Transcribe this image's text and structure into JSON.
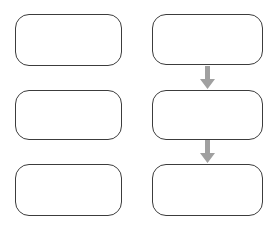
{
  "canvas": {
    "width": 276,
    "height": 232,
    "background_color": "#ffffff"
  },
  "style": {
    "node_stroke_color": "#3c3c3c",
    "node_fill_color": "#ffffff",
    "arrow_color": "#a0a0a0",
    "node_corner_radius": 14,
    "node_stroke_width": 1.4
  },
  "columns": [
    {
      "id": "left-column",
      "name": "left-column",
      "x": 15,
      "width": 107,
      "has_connectors": false
    },
    {
      "id": "right-column",
      "name": "right-column",
      "x": 152,
      "width": 111,
      "has_connectors": true
    }
  ],
  "nodes": [
    {
      "id": "left-node-1",
      "label": "",
      "column": "left-column",
      "row": 1,
      "x": 15,
      "y": 14,
      "width": 107,
      "height": 52
    },
    {
      "id": "left-node-2",
      "label": "",
      "column": "left-column",
      "row": 2,
      "x": 15,
      "y": 90,
      "width": 107,
      "height": 50
    },
    {
      "id": "left-node-3",
      "label": "",
      "column": "left-column",
      "row": 3,
      "x": 15,
      "y": 164,
      "width": 107,
      "height": 52
    },
    {
      "id": "right-node-1",
      "label": "",
      "column": "right-column",
      "row": 1,
      "x": 152,
      "y": 14,
      "width": 111,
      "height": 51
    },
    {
      "id": "right-node-2",
      "label": "",
      "column": "right-column",
      "row": 2,
      "x": 152,
      "y": 90,
      "width": 111,
      "height": 50
    },
    {
      "id": "right-node-3",
      "label": "",
      "column": "right-column",
      "row": 3,
      "x": 152,
      "y": 164,
      "width": 111,
      "height": 52
    }
  ],
  "connectors": [
    {
      "id": "arrow-right-1-to-2",
      "name": "arrow-down-icon",
      "from": "right-node-1",
      "to": "right-node-2",
      "direction": "down",
      "color": "#a0a0a0",
      "x": 199,
      "y": 66,
      "width": 17,
      "height": 24
    },
    {
      "id": "arrow-right-2-to-3",
      "name": "arrow-down-icon",
      "from": "right-node-2",
      "to": "right-node-3",
      "direction": "down",
      "color": "#a0a0a0",
      "x": 199,
      "y": 140,
      "width": 17,
      "height": 24
    }
  ]
}
